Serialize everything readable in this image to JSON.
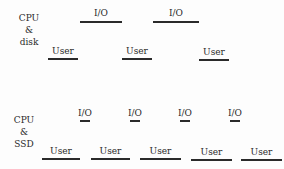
{
  "diagram": {
    "rows": [
      {
        "label_lines": [
          "CPU",
          "&",
          "disk"
        ],
        "io_label": "I/O",
        "user_label": "User",
        "io_segments": [
          {
            "x": 80,
            "w": 42
          },
          {
            "x": 153,
            "w": 46
          }
        ],
        "user_segments": [
          {
            "x": 48,
            "w": 30
          },
          {
            "x": 122,
            "w": 30
          },
          {
            "x": 199,
            "w": 30
          }
        ]
      },
      {
        "label_lines": [
          "CPU",
          "&",
          "SSD"
        ],
        "io_label": "I/O",
        "user_label": "User",
        "io_segments": [
          {
            "x": 79,
            "w": 12
          },
          {
            "x": 129,
            "w": 12
          },
          {
            "x": 179,
            "w": 12
          },
          {
            "x": 229,
            "w": 12
          }
        ],
        "user_segments": [
          {
            "x": 42,
            "w": 38
          },
          {
            "x": 91,
            "w": 39
          },
          {
            "x": 140,
            "w": 41
          },
          {
            "x": 191,
            "w": 41
          },
          {
            "x": 241,
            "w": 41
          }
        ]
      }
    ]
  }
}
